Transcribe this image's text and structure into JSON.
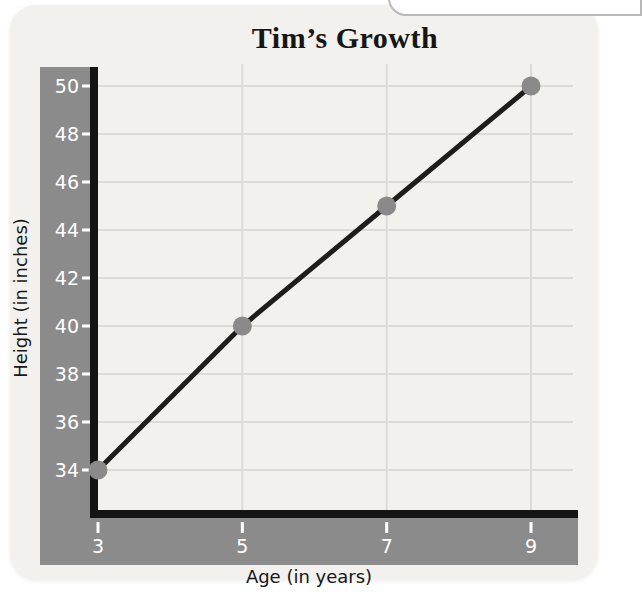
{
  "page": {
    "title": "Tim’s Growth"
  },
  "chart_data": {
    "type": "line",
    "title": "Tim’s Growth",
    "xlabel": "Age (in years)",
    "ylabel": "Height (in inches)",
    "x": [
      3,
      5,
      7,
      9
    ],
    "y": [
      34,
      40,
      45,
      50
    ],
    "series": [
      {
        "name": "Tim's height",
        "x": [
          3,
          5,
          7,
          9
        ],
        "values": [
          34,
          40,
          45,
          50
        ]
      }
    ],
    "x_ticks": [
      3,
      5,
      7,
      9
    ],
    "y_ticks": [
      34,
      36,
      38,
      40,
      42,
      44,
      46,
      48,
      50
    ],
    "xlim": [
      3,
      9.6
    ],
    "ylim": [
      32.3,
      50.9
    ],
    "grid": true,
    "legend": false
  },
  "colors": {
    "card_bg": "#f2f1ee",
    "band": "#8c8b8b",
    "axis": "#141414",
    "grid": "#dcdbd7",
    "line": "#1e1d1b",
    "point": "#8a8a8a",
    "tick_label": "#ffffff",
    "text": "#161616",
    "overlay_border": "#b8b8b8"
  }
}
